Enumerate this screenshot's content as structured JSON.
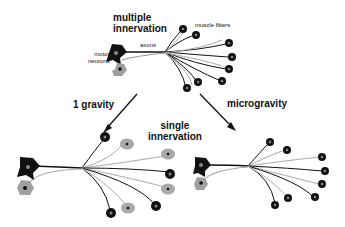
{
  "labels": {
    "top_title_line1": "multiple",
    "top_title_line2": "innervation",
    "axons": "axons",
    "muscle_fibers": "muscle fibers",
    "motor_neurons_line1": "motor",
    "motor_neurons_line2": "neurons",
    "left_arrow": "1 gravity",
    "right_arrow": "microgravity",
    "bottom_title_line1": "single",
    "bottom_title_line2": "innervation"
  },
  "colors": {
    "black_neuron": "#111111",
    "gray_neuron": "#a0a0a0",
    "fiber_gray": "#a8a8a8",
    "background": "#ffffff"
  }
}
